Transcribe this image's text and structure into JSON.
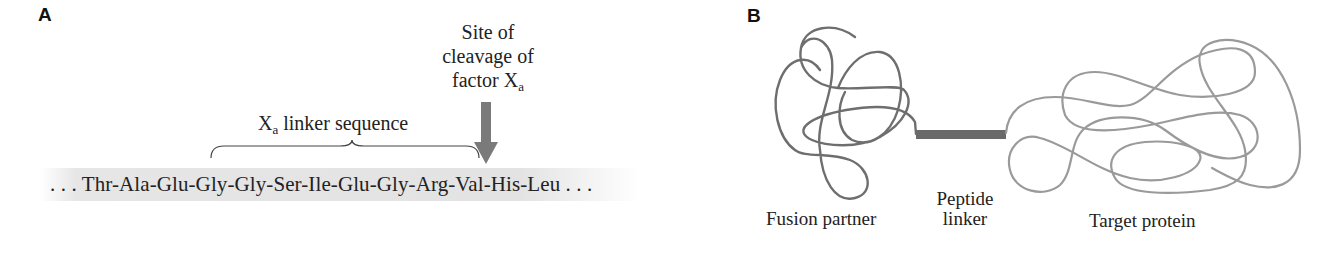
{
  "panels": {
    "a": {
      "label": "A",
      "cleavage_site": {
        "line1": "Site of",
        "line2": "cleavage of",
        "line3_prefix": "factor X",
        "line3_sub": "a"
      },
      "linker_label": {
        "prefix": "X",
        "sub": "a",
        "suffix": " linker sequence"
      },
      "sequence": ". . . Thr-Ala-Glu-Gly-Gly-Ser-Ile-Glu-Gly-Arg-Val-His-Leu . . .",
      "residues": [
        "Thr",
        "Ala",
        "Glu",
        "Gly",
        "Gly",
        "Ser",
        "Ile",
        "Glu",
        "Gly",
        "Arg",
        "Val",
        "His",
        "Leu"
      ],
      "linker_residues": [
        "Ser",
        "Ile",
        "Glu",
        "Gly",
        "Arg"
      ],
      "cleavage_after": "Arg",
      "arrow_color": "#7a7a7a",
      "band_color": "#e4e4e4"
    },
    "b": {
      "label": "B",
      "fusion_partner_label": "Fusion partner",
      "peptide_linker_line1": "Peptide",
      "peptide_linker_line2": "linker",
      "target_protein_label": "Target protein",
      "fusion_color": "#6e6e6e",
      "linker_color": "#6a6a6a",
      "target_color": "#9a9a9a"
    }
  }
}
